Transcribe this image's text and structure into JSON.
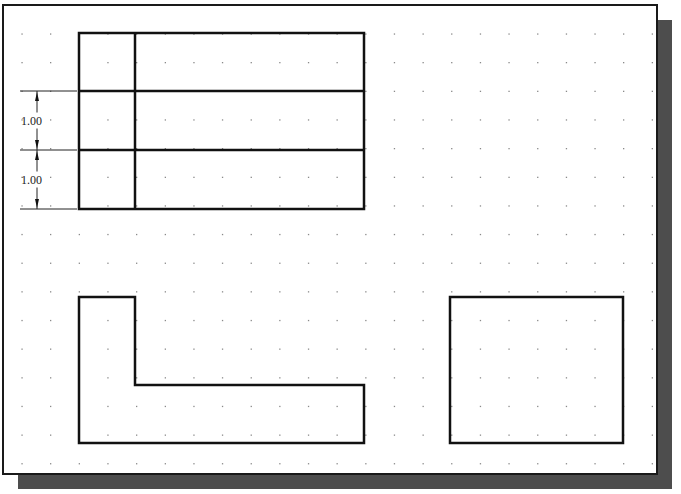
{
  "drawing": {
    "sheet": {
      "x": 3,
      "y": 5,
      "width": 654,
      "height": 469,
      "stroke": "#1a1a1a",
      "fill": "#ffffff",
      "shadow_color": "#4d4d4d",
      "shadow_offset": 15
    },
    "grid": {
      "origin_x": 22,
      "origin_y": 34,
      "pitch": 28.65,
      "cols": 23,
      "rows": 16,
      "dot_color": "#8a8a8a"
    },
    "line_color": "#111111",
    "line_width": 2.5,
    "top_view": {
      "x": 79,
      "y": 33,
      "width": 285,
      "height": 176,
      "row_lines_y": [
        91,
        150
      ],
      "col_lines_x": [
        135
      ]
    },
    "front_view": {
      "points": "79,297 135,297 135,385 364,385 364,443 79,443"
    },
    "side_view": {
      "x": 450,
      "y": 297,
      "width": 173,
      "height": 146
    },
    "dimensions": [
      {
        "label": "1.00",
        "y1": 91,
        "y2": 150
      },
      {
        "label": "1.00",
        "y1": 150,
        "y2": 209
      }
    ],
    "dimension_line_x": 37,
    "extension_line_x1": 20,
    "extension_line_x2": 77
  }
}
